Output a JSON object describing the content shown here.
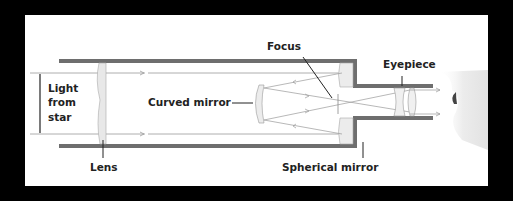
{
  "diagram": {
    "labels": {
      "light_from_star": [
        "Light",
        "from",
        "star"
      ],
      "lens": "Lens",
      "curved_mirror": "Curved mirror",
      "focus": "Focus",
      "eyepiece": "Eyepiece",
      "spherical_mirror": "Spherical mirror"
    },
    "colors": {
      "background": "#000000",
      "panel": "#ffffff",
      "tube": "#6e6e6e",
      "ray": "#9a9a9a",
      "text": "#222222"
    }
  }
}
